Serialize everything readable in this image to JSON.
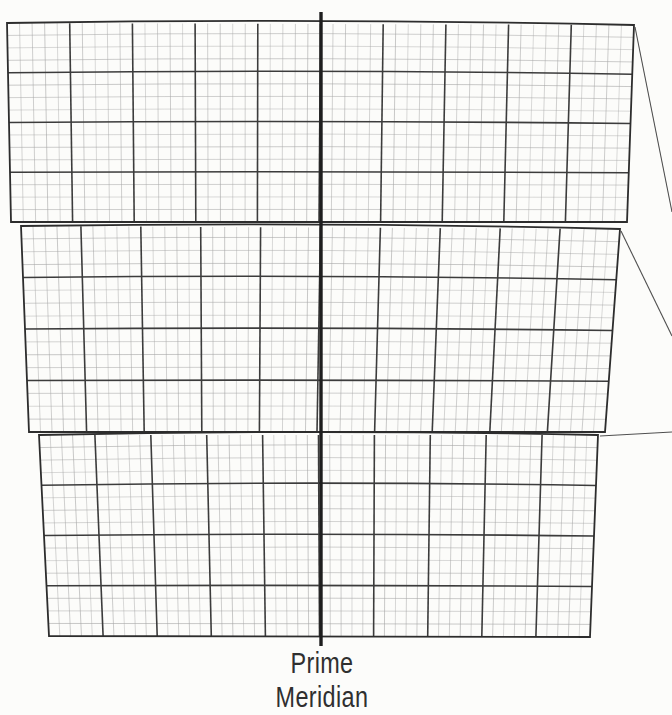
{
  "figure": {
    "label": {
      "line1": "Prime",
      "line2": "Meridian"
    },
    "colors": {
      "background": "#fcfcfa",
      "fine_line": "#a6a6a6",
      "major_line": "#3c3c3c",
      "outline": "#2d2d2d",
      "prime_meridian": "#1e1e1e",
      "leader_line": "#4f4f4f",
      "label_text": "#2f2f2f"
    },
    "grid": {
      "fine_cols": 50,
      "fine_rows": 16,
      "major_col_every": 5,
      "major_row_every": 4,
      "top_bulge_px": 3
    },
    "bands": [
      {
        "name": "zone-band-1",
        "tl": [
          7,
          23
        ],
        "tr": [
          634,
          25
        ],
        "br": [
          627,
          222
        ],
        "bl": [
          11,
          222
        ]
      },
      {
        "name": "zone-band-2",
        "tl": [
          21,
          226
        ],
        "tr": [
          620,
          229
        ],
        "br": [
          605,
          432
        ],
        "bl": [
          29,
          432
        ]
      },
      {
        "name": "zone-band-3",
        "tl": [
          39,
          435
        ],
        "tr": [
          598,
          435
        ],
        "br": [
          590,
          637
        ],
        "bl": [
          49,
          636
        ]
      }
    ],
    "prime_meridian": {
      "x": 321,
      "y_top": 12,
      "y_bottom": 646,
      "stroke_width": 3.4
    },
    "leader_lines": [
      {
        "from": [
          635,
          27
        ],
        "to": [
          672,
          212
        ]
      },
      {
        "from": [
          621,
          231
        ],
        "to": [
          672,
          336
        ]
      },
      {
        "from": [
          600,
          436
        ],
        "to": [
          672,
          432
        ]
      }
    ]
  }
}
